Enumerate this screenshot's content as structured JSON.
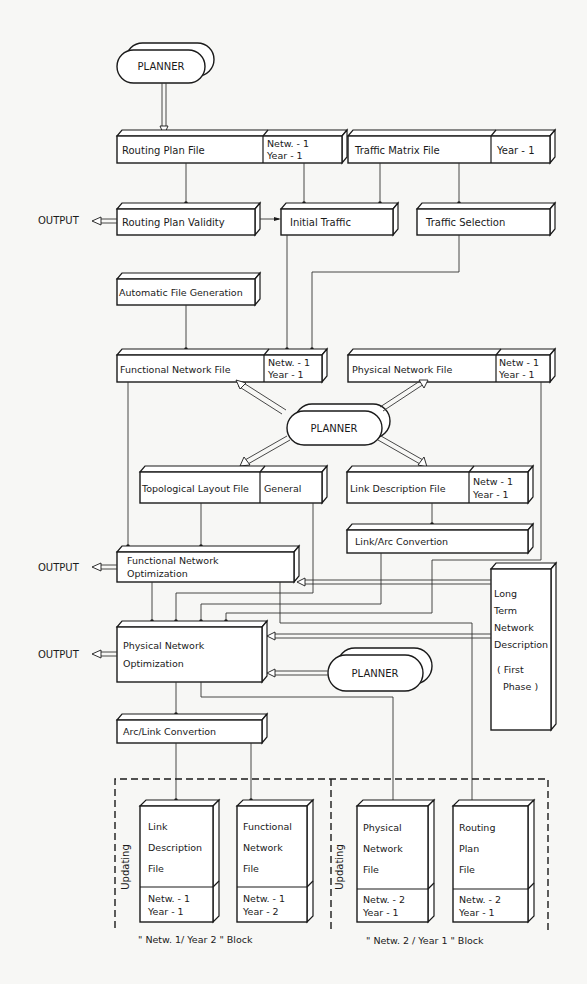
{
  "planner_label": "PLANNER",
  "output_label": "OUTPUT",
  "boxes": {
    "routing_plan_file": {
      "label": "Routing  Plan  File",
      "tag1": "Netw. - 1",
      "tag2": "Year  - 1"
    },
    "traffic_matrix_file": {
      "label": "Traffic  Matrix  File",
      "tag1": "Year - 1"
    },
    "routing_plan_validity": {
      "label": "Routing  Plan  Validity"
    },
    "initial_traffic": {
      "label": "Initial  Traffic"
    },
    "traffic_selection": {
      "label": "Traffic  Selection"
    },
    "automatic_file_generation": {
      "label": "Automatic  File  Generation"
    },
    "functional_network_file": {
      "label": "Functional  Network  File",
      "tag1": "Netw. - 1",
      "tag2": "Year  - 1"
    },
    "physical_network_file": {
      "label": "Physical  Network  File",
      "tag1": "Netw - 1",
      "tag2": "Year - 1"
    },
    "topological_layout_file": {
      "label": "Topological  Layout  File",
      "tag1": "General"
    },
    "link_description_file": {
      "label": "Link  Description  File",
      "tag1": "Netw - 1",
      "tag2": "Year - 1"
    },
    "link_arc_convertion": {
      "label": "Link/Arc   Convertion"
    },
    "functional_network_optimization": {
      "line1": "Functional  Network",
      "line2": "Optimization"
    },
    "physical_network_optimization": {
      "line1": "Physical   Network",
      "line2": "Optimization"
    },
    "arc_link_convertion": {
      "label": "Arc/Link   Convertion"
    },
    "long_term": {
      "lines": [
        "Long",
        "Term",
        "Network",
        "Description"
      ],
      "phase1": "( First",
      "phase2": "Phase )"
    }
  },
  "blocks": [
    {
      "side_label": "Updating",
      "caption": "\" Netw. 1/  Year  2 \"    Block",
      "files": [
        {
          "lines": [
            "Link",
            "Description",
            "File"
          ],
          "tag1": "Netw. - 1",
          "tag2": "Year  - 1"
        },
        {
          "lines": [
            "Functional",
            "Network",
            "File"
          ],
          "tag1": "Netw. - 1",
          "tag2": "Year  - 2"
        }
      ]
    },
    {
      "side_label": "Updating",
      "caption": "\" Netw. 2 / Year 1 \"   Block",
      "files": [
        {
          "lines": [
            "Physical",
            "Network",
            "File"
          ],
          "tag1": "Netw. - 2",
          "tag2": "Year  - 1"
        },
        {
          "lines": [
            "Routing",
            "Plan",
            "File"
          ],
          "tag1": "Netw. - 2",
          "tag2": "Year  - 1"
        }
      ]
    }
  ]
}
